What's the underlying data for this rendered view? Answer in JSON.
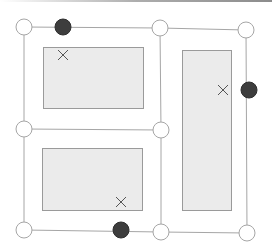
{
  "diagram": {
    "colors": {
      "edge": "#a6a6a6",
      "node_fill_open": "#ffffff",
      "node_stroke": "#a6a6a6",
      "node_fill_filled": "#3d3d3d",
      "region_fill": "#ebebeb",
      "region_stroke": "#9a9a9a",
      "marker": "#555555",
      "top_edge_gradient": "#5a5a5a"
    },
    "open_nodes": [
      {
        "id": "n-top-left",
        "x": 24,
        "y": 27
      },
      {
        "id": "n-top-mid",
        "x": 160,
        "y": 28
      },
      {
        "id": "n-top-right",
        "x": 246,
        "y": 30
      },
      {
        "id": "n-mid-left",
        "x": 24,
        "y": 129
      },
      {
        "id": "n-mid-center",
        "x": 161,
        "y": 130
      },
      {
        "id": "n-bottom-left",
        "x": 24,
        "y": 230
      },
      {
        "id": "n-bottom-mid",
        "x": 161,
        "y": 232
      },
      {
        "id": "n-bottom-right",
        "x": 247,
        "y": 233
      }
    ],
    "filled_nodes": [
      {
        "id": "f-top",
        "x": 63,
        "y": 27
      },
      {
        "id": "f-right",
        "x": 249,
        "y": 90
      },
      {
        "id": "f-bottom",
        "x": 121,
        "y": 230
      }
    ],
    "edges": [
      {
        "from": "n-top-left",
        "to": "n-top-mid"
      },
      {
        "from": "n-top-mid",
        "to": "n-top-right"
      },
      {
        "from": "n-top-left",
        "to": "n-mid-left"
      },
      {
        "from": "n-mid-left",
        "to": "n-bottom-left"
      },
      {
        "from": "n-top-mid",
        "to": "n-mid-center"
      },
      {
        "from": "n-mid-center",
        "to": "n-bottom-mid"
      },
      {
        "from": "n-mid-left",
        "to": "n-mid-center"
      },
      {
        "from": "n-bottom-left",
        "to": "n-bottom-mid"
      },
      {
        "from": "n-bottom-mid",
        "to": "n-bottom-right"
      },
      {
        "from": "n-top-right",
        "to": "n-bottom-right"
      }
    ],
    "regions": [
      {
        "id": "region-top-left",
        "x": 43,
        "y": 47,
        "w": 100,
        "h": 61,
        "marker": {
          "x": 63,
          "y": 55
        }
      },
      {
        "id": "region-bottom-left",
        "x": 42,
        "y": 148,
        "w": 100,
        "h": 62,
        "marker": {
          "x": 121,
          "y": 202
        }
      },
      {
        "id": "region-right",
        "x": 182,
        "y": 50,
        "w": 49,
        "h": 160,
        "marker": {
          "x": 223,
          "y": 90
        }
      }
    ],
    "node_radius": 8,
    "filled_node_radius": 8,
    "marker_size": 5
  }
}
